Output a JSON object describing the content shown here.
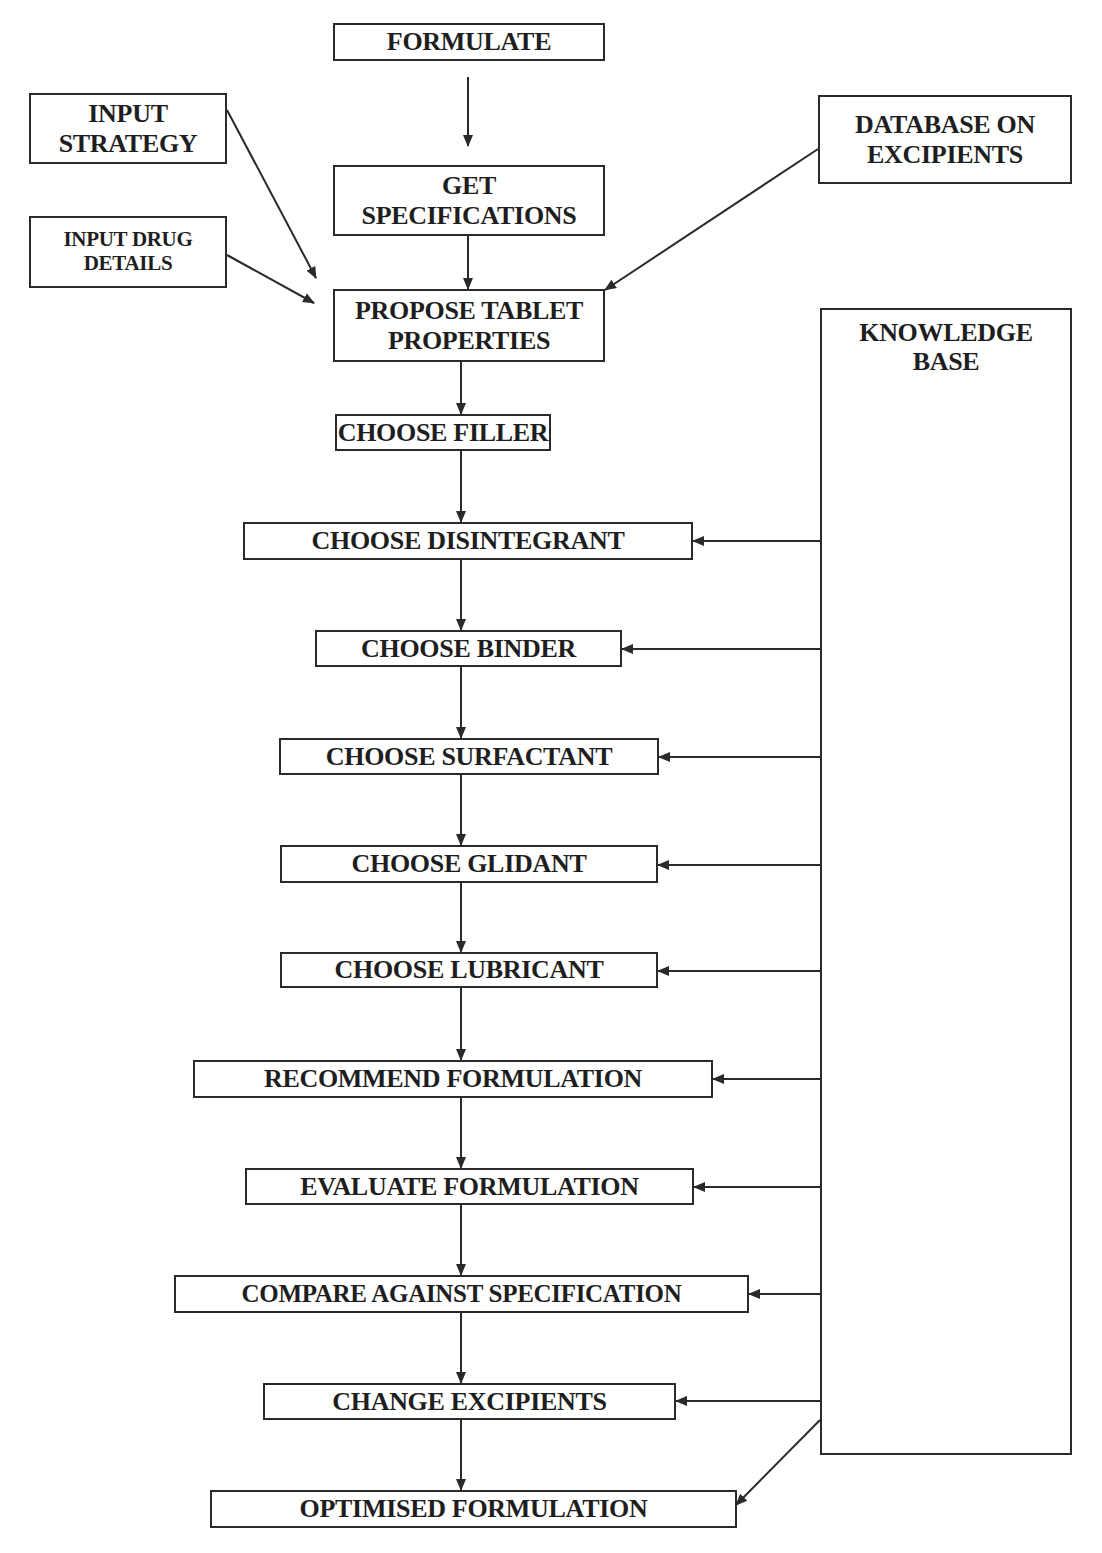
{
  "diagram": {
    "type": "flowchart",
    "main_flow": [
      {
        "id": "formulate",
        "label": "FORMULATE"
      },
      {
        "id": "get_specifications",
        "label": "GET\nSPECIFICATIONS"
      },
      {
        "id": "propose_tablet_properties",
        "label": "PROPOSE TABLET\nPROPERTIES"
      },
      {
        "id": "choose_filler",
        "label": "CHOOSE FILLER"
      },
      {
        "id": "choose_disintegrant",
        "label": "CHOOSE DISINTEGRANT"
      },
      {
        "id": "choose_binder",
        "label": "CHOOSE BINDER"
      },
      {
        "id": "choose_surfactant",
        "label": "CHOOSE SURFACTANT"
      },
      {
        "id": "choose_glidant",
        "label": "CHOOSE GLIDANT"
      },
      {
        "id": "choose_lubricant",
        "label": "CHOOSE LUBRICANT"
      },
      {
        "id": "recommend_formulation",
        "label": "RECOMMEND FORMULATION"
      },
      {
        "id": "evaluate_formulation",
        "label": "EVALUATE FORMULATION"
      },
      {
        "id": "compare_against_specification",
        "label": "COMPARE AGAINST SPECIFICATION"
      },
      {
        "id": "change_excipients",
        "label": "CHANGE EXCIPIENTS"
      },
      {
        "id": "optimised_formulation",
        "label": "OPTIMISED FORMULATION"
      }
    ],
    "inputs": [
      {
        "id": "input_strategy",
        "label": "INPUT\nSTRATEGY",
        "target": "propose_tablet_properties"
      },
      {
        "id": "input_drug_details",
        "label": "INPUT DRUG\nDETAILS",
        "target": "propose_tablet_properties"
      },
      {
        "id": "database_on_excipients",
        "label": "DATABASE ON\nEXCIPIENTS",
        "target": "propose_tablet_properties"
      }
    ],
    "knowledge_base": {
      "id": "knowledge_base",
      "label": "KNOWLEDGE\nBASE",
      "feeds": [
        "choose_disintegrant",
        "choose_binder",
        "choose_surfactant",
        "choose_glidant",
        "choose_lubricant",
        "recommend_formulation",
        "evaluate_formulation",
        "compare_against_specification",
        "change_excipients",
        "optimised_formulation"
      ]
    },
    "colors": {
      "line": "#2a2a2a",
      "background": "#ffffff",
      "text": "#1e1e1e"
    }
  }
}
